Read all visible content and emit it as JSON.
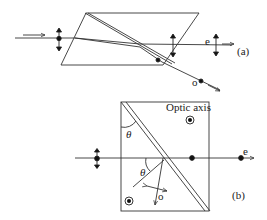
{
  "figure": {
    "panel_a": {
      "label": "(a)",
      "e_ray_label": "e",
      "o_ray_label": "o"
    },
    "panel_b": {
      "label": "(b)",
      "optic_axis_label": "Optic axis",
      "angle_label_1": "θ",
      "angle_label_2": "θ",
      "e_ray_label": "e",
      "o_ray_label": "o"
    },
    "colors": {
      "line": "#333333",
      "background": "#ffffff"
    }
  }
}
